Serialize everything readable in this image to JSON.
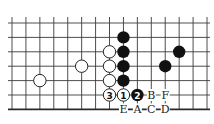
{
  "diagram": {
    "type": "go-board-fragment",
    "grid": {
      "columns": 15,
      "rows": 7,
      "origin_x": 12,
      "origin_y": 23,
      "spacing_x": 13.93,
      "spacing_y": 14.4,
      "top_extend": 6,
      "left_extend": 4,
      "right_extend": 3,
      "bottom_edge": true
    },
    "colors": {
      "line": "#3a3a3a",
      "black_stone": "#111111",
      "white_stone": "#ffffff",
      "background": "#ffffff"
    },
    "stone_radius": 6.2,
    "stones": [
      {
        "color": "black",
        "col": 8,
        "row": 1,
        "label": ""
      },
      {
        "color": "black",
        "col": 8,
        "row": 2,
        "label": ""
      },
      {
        "color": "black",
        "col": 8,
        "row": 3,
        "label": ""
      },
      {
        "color": "black",
        "col": 8,
        "row": 4,
        "label": ""
      },
      {
        "color": "black",
        "col": 12,
        "row": 2,
        "label": ""
      },
      {
        "color": "black",
        "col": 11,
        "row": 3,
        "label": ""
      },
      {
        "color": "white",
        "col": 7,
        "row": 2,
        "label": ""
      },
      {
        "color": "white",
        "col": 7,
        "row": 3,
        "label": ""
      },
      {
        "color": "white",
        "col": 7,
        "row": 4,
        "label": ""
      },
      {
        "color": "white",
        "col": 5,
        "row": 3,
        "label": ""
      },
      {
        "color": "white",
        "col": 2,
        "row": 4,
        "label": ""
      },
      {
        "color": "white",
        "col": 8,
        "row": 5,
        "label": "1"
      },
      {
        "color": "black",
        "col": 9,
        "row": 5,
        "label": "2"
      },
      {
        "color": "white",
        "col": 7,
        "row": 5,
        "label": "3"
      }
    ],
    "point_labels": [
      {
        "text": "B",
        "col": 10,
        "row": 5
      },
      {
        "text": "F",
        "col": 11,
        "row": 5
      },
      {
        "text": "E",
        "col": 8,
        "row": 6
      },
      {
        "text": "A",
        "col": 9,
        "row": 6
      },
      {
        "text": "C",
        "col": 10,
        "row": 6
      },
      {
        "text": "D",
        "col": 11,
        "row": 6
      }
    ]
  }
}
